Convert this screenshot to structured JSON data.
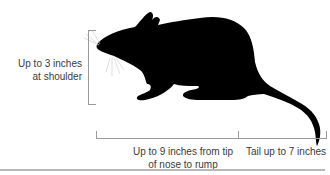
{
  "figure": {
    "labels": {
      "height": "Up to 3 inches at shoulder",
      "height_line1": "Up to 3 inches",
      "height_line2": "at shoulder",
      "body_line1": "Up to 9 inches from tip",
      "body_line2": "of nose to rump",
      "tail": "Tail up to 7 inches"
    },
    "colors": {
      "silhouette": "#000000",
      "bracket": "#9a9a9a",
      "text": "#3a3a3a",
      "rule": "#b8b8b8"
    }
  }
}
